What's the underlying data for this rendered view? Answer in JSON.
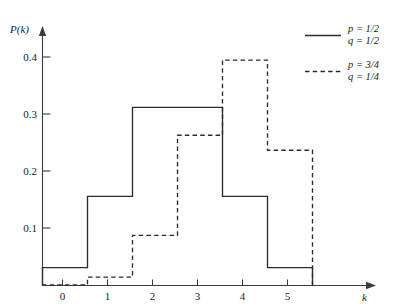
{
  "chart_data": {
    "type": "bar",
    "title": "",
    "subtitle": "",
    "xlabel": "k",
    "ylabel": "P(k)",
    "categories": [
      "0",
      "1",
      "2",
      "3",
      "4",
      "5"
    ],
    "x": [
      0,
      1,
      2,
      3,
      4,
      5
    ],
    "xlim": [
      -0.5,
      5.5
    ],
    "ylim": [
      0,
      0.45
    ],
    "grid": false,
    "legend_position": "top-right",
    "x_ticks": [
      "0",
      "1",
      "2",
      "3",
      "4",
      "5"
    ],
    "y_ticks": [
      "0.1",
      "0.2",
      "0.3",
      "0.4"
    ],
    "y_tick_values": [
      0.1,
      0.2,
      0.3,
      0.4
    ],
    "series": [
      {
        "name": "p = 1/2, q = 1/2",
        "style": "solid",
        "values": [
          0.03125,
          0.15625,
          0.3125,
          0.3125,
          0.15625,
          0.03125
        ]
      },
      {
        "name": "p = 3/4, q = 1/4",
        "style": "dashed",
        "values": [
          0.00098,
          0.01465,
          0.08789,
          0.26367,
          0.39551,
          0.2373
        ]
      }
    ]
  },
  "axes": {
    "y_title": "P(k)",
    "x_title": "k",
    "y_tick_labels": [
      "0.1",
      "0.2",
      "0.3",
      "0.4"
    ],
    "x_tick_labels": [
      "0",
      "1",
      "2",
      "3",
      "4",
      "5"
    ]
  },
  "legend": {
    "entries": [
      {
        "style": "solid",
        "line1": "p = 1/2",
        "line2": "q = 1/2"
      },
      {
        "style": "dashed",
        "line1": "p = 3/4",
        "line2": "q = 1/4"
      }
    ]
  },
  "colors": {
    "ink": "#2b2b2b",
    "axis": "#3a3a3a",
    "background": "#ffffff"
  }
}
